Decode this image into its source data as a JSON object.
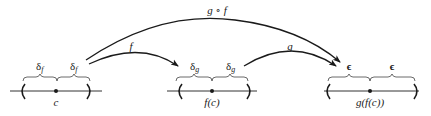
{
  "diagram": {
    "number_lines": [
      {
        "id": "domain-line",
        "point_label": "c",
        "half_width_label": "δ",
        "half_width_subscript": "f"
      },
      {
        "id": "middle-line",
        "point_label": "f(c)",
        "half_width_label": "δ",
        "half_width_subscript": "g"
      },
      {
        "id": "range-line",
        "point_label": "g(f(c))",
        "half_width_label": "ϵ",
        "half_width_subscript": ""
      }
    ],
    "arrows": [
      {
        "id": "arrow-f",
        "label": "f",
        "from": "domain-line",
        "to": "middle-line"
      },
      {
        "id": "arrow-g",
        "label": "g",
        "from": "middle-line",
        "to": "range-line"
      },
      {
        "id": "arrow-gof",
        "label": "g ∘ f",
        "from": "domain-line",
        "to": "range-line"
      }
    ],
    "colors": {
      "ink": "#1a1a1a",
      "background": "#ffffff"
    }
  }
}
